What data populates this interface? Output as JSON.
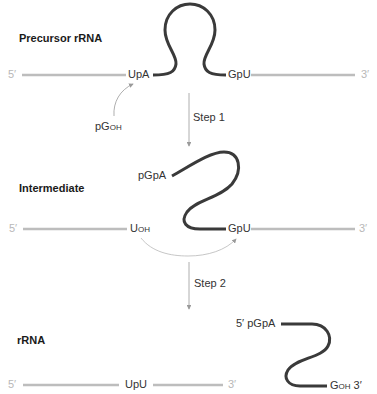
{
  "stages": {
    "precursor": {
      "title": "Precursor rRNA",
      "five_prime": "5′",
      "three_prime": "3′",
      "left_junction": "UpA",
      "right_junction": "GpU",
      "cofactor_main": "pG",
      "cofactor_sub": "OH"
    },
    "intermediate": {
      "title": "Intermediate",
      "five_prime": "5′",
      "three_prime": "3′",
      "left_end_main": "U",
      "left_end_sub": "OH",
      "intron_end": "pGpA",
      "right_junction": "GpU"
    },
    "product": {
      "title": "rRNA",
      "five_prime": "5′",
      "three_prime": "3′",
      "ligated_junction": "UpU",
      "intron_start": "5′ pGpA",
      "intron_end_main": "G",
      "intron_end_sub": "OH",
      "intron_end_suffix": " 3′"
    }
  },
  "steps": [
    {
      "label": "Step 1"
    },
    {
      "label": "Step 2"
    }
  ],
  "colors": {
    "exon_line": "#bdbdbd",
    "intron_line": "#3a3a3a",
    "arrow": "#9a9a9a",
    "end_label": "#b8b8b8"
  }
}
